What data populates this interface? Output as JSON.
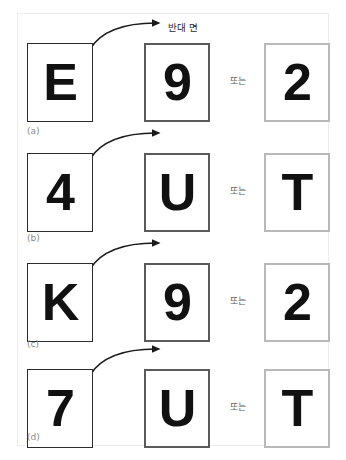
{
  "figure": {
    "flip_label": "반대 면",
    "or_label": "또는",
    "arrow_icon": "curved-arrow-right-icon",
    "colors": {
      "source_border": "#2b2b2b",
      "middle_border": "#5a5a5a",
      "right_border": "#b9b9b9",
      "glyph": "#111111",
      "outer_frame": "#ececec",
      "label": "#8a8a8a"
    },
    "rows": [
      {
        "id": "a",
        "label": "(a)",
        "source": "E",
        "middle": "9",
        "right": "2"
      },
      {
        "id": "b",
        "label": "(b)",
        "source": "4",
        "middle": "U",
        "right": "T"
      },
      {
        "id": "c",
        "label": "(c)",
        "source": "K",
        "middle": "9",
        "right": "2"
      },
      {
        "id": "d",
        "label": "(d)",
        "source": "7",
        "middle": "U",
        "right": "T"
      }
    ]
  }
}
